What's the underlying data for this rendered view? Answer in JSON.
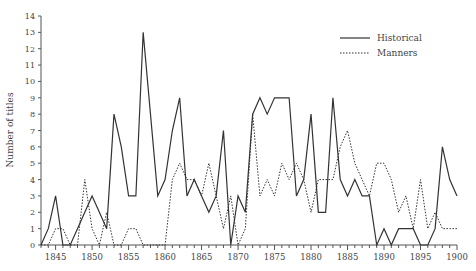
{
  "chart_data": {
    "type": "line",
    "title": "",
    "xlabel": "",
    "ylabel": "Number of titles",
    "xlim": [
      1843,
      1900
    ],
    "ylim": [
      0,
      14
    ],
    "x_ticks": [
      1845,
      1850,
      1855,
      1860,
      1865,
      1870,
      1875,
      1880,
      1885,
      1890,
      1895,
      1900
    ],
    "y_ticks": [
      0,
      1,
      2,
      3,
      4,
      5,
      6,
      7,
      8,
      9,
      10,
      11,
      12,
      13,
      14
    ],
    "grid": false,
    "legend_position": "top-right",
    "x": [
      1843,
      1844,
      1845,
      1846,
      1847,
      1848,
      1849,
      1850,
      1851,
      1852,
      1853,
      1854,
      1855,
      1856,
      1857,
      1858,
      1859,
      1860,
      1861,
      1862,
      1863,
      1864,
      1865,
      1866,
      1867,
      1868,
      1869,
      1870,
      1871,
      1872,
      1873,
      1874,
      1875,
      1876,
      1877,
      1878,
      1879,
      1880,
      1881,
      1882,
      1883,
      1884,
      1885,
      1886,
      1887,
      1888,
      1889,
      1890,
      1891,
      1892,
      1893,
      1894,
      1895,
      1896,
      1897,
      1898,
      1899,
      1900
    ],
    "series": [
      {
        "name": "Historical",
        "style": "solid",
        "values": [
          0,
          1,
          3,
          0,
          0,
          1,
          2,
          3,
          2,
          1,
          8,
          6,
          3,
          3,
          13,
          8,
          3,
          4,
          7,
          9,
          3,
          4,
          3,
          2,
          3,
          7,
          0,
          3,
          2,
          8,
          9,
          8,
          9,
          9,
          9,
          3,
          4,
          8,
          2,
          2,
          9,
          4,
          3,
          4,
          3,
          3,
          0,
          1,
          0,
          1,
          1,
          1,
          0,
          0,
          1,
          6,
          4,
          3
        ]
      },
      {
        "name": "Manners",
        "style": "dotted",
        "values": [
          0,
          0,
          1,
          1,
          0,
          0,
          4,
          1,
          0,
          2,
          0,
          0,
          1,
          1,
          0,
          0,
          0,
          0,
          4,
          5,
          4,
          4,
          3,
          5,
          3,
          1,
          3,
          0,
          1,
          8,
          3,
          4,
          3,
          5,
          4,
          5,
          4,
          2,
          4,
          4,
          4,
          6,
          7,
          5,
          4,
          3,
          5,
          5,
          4,
          2,
          3,
          1,
          4,
          1,
          2,
          1,
          1,
          1
        ]
      }
    ]
  },
  "legend": {
    "items": [
      "Historical",
      "Manners"
    ]
  },
  "axis": {
    "ylabel": "Number of titles"
  }
}
